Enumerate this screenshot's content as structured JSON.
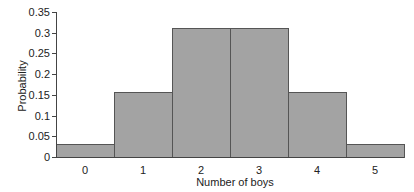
{
  "chart_data": {
    "type": "bar",
    "title": "",
    "xlabel": "Number of boys",
    "ylabel": "Probability",
    "categories": [
      "0",
      "1",
      "2",
      "3",
      "4",
      "5"
    ],
    "values": [
      0.03125,
      0.15625,
      0.3125,
      0.3125,
      0.15625,
      0.03125
    ],
    "ylim": [
      0,
      0.35
    ],
    "yticks": [
      "0",
      "0.05",
      "0.1",
      "0.15",
      "0.2",
      "0.25",
      "0.3",
      "0.35"
    ],
    "grid": false,
    "legend": null,
    "bar_color": "#a3a3a3",
    "edge_color": "#555555",
    "bar_width": 1.0
  }
}
